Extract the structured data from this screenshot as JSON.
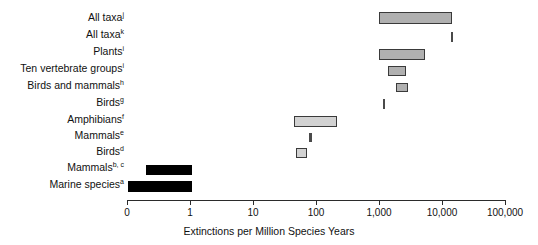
{
  "chart_data": {
    "type": "bar",
    "orientation": "horizontal",
    "title": "",
    "xlabel": "Extinctions per Million Species Years",
    "ylabel": "",
    "xscale": "log",
    "xlim": [
      0,
      100000
    ],
    "grid": false,
    "legend": false,
    "xticks": [
      {
        "label": "0",
        "value": 0,
        "px": 127
      },
      {
        "label": "1",
        "value": 1,
        "px": 190
      },
      {
        "label": "10",
        "value": 10,
        "px": 253
      },
      {
        "label": "100",
        "value": 100,
        "px": 316
      },
      {
        "label": "1,000",
        "value": 1000,
        "px": 379
      },
      {
        "label": "10,000",
        "value": 10000,
        "px": 442
      },
      {
        "label": "100,000",
        "value": 100000,
        "px": 505
      }
    ],
    "categories": [
      "All taxa j",
      "All taxa k",
      "Plants i",
      "Ten vertebrate groups i",
      "Birds and mammals h",
      "Birds g",
      "Amphibians f",
      "Mammals e",
      "Birds d",
      "Mammals b, c",
      "Marine species a"
    ],
    "series": [
      {
        "name": "Extinction rate range",
        "bars": [
          {
            "label": "All taxa",
            "sup": "j",
            "low": 1000,
            "high": 13000,
            "style": "grey",
            "y": 12,
            "x": 379,
            "w": 73,
            "h": 12
          },
          {
            "label": "All taxa",
            "sup": "k",
            "low": 9000,
            "high": 9000,
            "style": "tick",
            "y": 32,
            "x": 451,
            "w": 2,
            "h": 10
          },
          {
            "label": "Plants",
            "sup": "i",
            "low": 1000,
            "high": 4500,
            "style": "grey",
            "y": 49,
            "x": 379,
            "w": 46,
            "h": 11
          },
          {
            "label": "Ten vertebrate groups",
            "sup": "i",
            "low": 1600,
            "high": 2600,
            "style": "grey",
            "y": 66,
            "x": 388,
            "w": 18,
            "h": 10
          },
          {
            "label": "Birds and mammals",
            "sup": "h",
            "low": 2000,
            "high": 2500,
            "style": "grey",
            "y": 83,
            "x": 396,
            "w": 12,
            "h": 9
          },
          {
            "label": "Birds",
            "sup": "g",
            "low": 1000,
            "high": 1000,
            "style": "tick",
            "y": 99,
            "x": 383,
            "w": 2,
            "h": 10
          },
          {
            "label": "Amphibians",
            "sup": "f",
            "low": 50,
            "high": 200,
            "style": "lightgrey",
            "y": 116,
            "x": 294,
            "w": 43,
            "h": 11
          },
          {
            "label": "Mammals",
            "sup": "e",
            "low": 75,
            "high": 75,
            "style": "tick",
            "y": 133,
            "x": 309,
            "w": 3,
            "h": 9
          },
          {
            "label": "Birds",
            "sup": "d",
            "low": 55,
            "high": 70,
            "style": "lightgrey",
            "y": 148,
            "x": 296,
            "w": 11,
            "h": 10
          },
          {
            "label": "Mammals",
            "sup": "b, c",
            "low": 0.2,
            "high": 1,
            "style": "black",
            "y": 165,
            "x": 146,
            "w": 46,
            "h": 10
          },
          {
            "label": "Marine species",
            "sup": "a",
            "low": 0,
            "high": 1,
            "style": "black",
            "y": 181,
            "x": 128,
            "w": 64,
            "h": 11
          }
        ]
      }
    ],
    "labels": [
      {
        "text": "All taxa",
        "sup": "j",
        "y": 12
      },
      {
        "text": "All taxa",
        "sup": "k",
        "y": 29
      },
      {
        "text": "Plants",
        "sup": "i",
        "y": 46
      },
      {
        "text": "Ten vertebrate groups",
        "sup": "i",
        "y": 63
      },
      {
        "text": "Birds and mammals",
        "sup": "h",
        "y": 80
      },
      {
        "text": "Birds",
        "sup": "g",
        "y": 97
      },
      {
        "text": "Amphibians",
        "sup": "f",
        "y": 114
      },
      {
        "text": "Mammals",
        "sup": "e",
        "y": 130
      },
      {
        "text": "Birds",
        "sup": "d",
        "y": 146
      },
      {
        "text": "Mammals",
        "sup": "b, c",
        "y": 162
      },
      {
        "text": "Marine species",
        "sup": "a",
        "y": 179
      }
    ]
  }
}
